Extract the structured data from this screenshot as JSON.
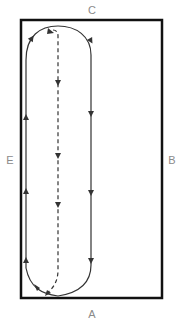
{
  "diagram": {
    "type": "dressage arena movement pattern",
    "markers": {
      "top": "C",
      "bottom": "A",
      "left": "E",
      "right": "B"
    },
    "colors": {
      "arena_border": "#111111",
      "path_line": "#333333",
      "marker_text": "#8a8a8a"
    },
    "paths": [
      {
        "name": "solid-loop",
        "style": "solid",
        "direction": "down right side, up left side"
      },
      {
        "name": "center-line",
        "style": "dashed",
        "direction": "down center, curving to lower left"
      }
    ]
  }
}
